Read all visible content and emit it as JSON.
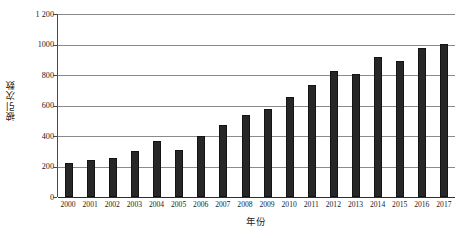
{
  "chart_data": {
    "type": "bar",
    "title": "",
    "xlabel": "年份",
    "ylabel": "被引次数",
    "categories": [
      "2000",
      "2001",
      "2002",
      "2003",
      "2004",
      "2005",
      "2006",
      "2007",
      "2008",
      "2009",
      "2010",
      "2011",
      "2012",
      "2013",
      "2014",
      "2015",
      "2016",
      "2017"
    ],
    "values": [
      220,
      240,
      255,
      300,
      365,
      310,
      400,
      475,
      535,
      580,
      655,
      735,
      825,
      805,
      920,
      890,
      980,
      1005
    ],
    "ylim": [
      0,
      1200
    ],
    "ytick_values": [
      0,
      200,
      400,
      600,
      800,
      1000,
      1200
    ],
    "ytick_labels": [
      "0",
      "200",
      "400",
      "600",
      "800",
      "1000",
      "1 200"
    ],
    "grid": true,
    "legend": null,
    "bar_color": "#272727",
    "gridline_color": "#8a8a8a",
    "axis_color": "#4a4a4a",
    "series": [
      {
        "name": "被引次数",
        "values": [
          220,
          240,
          255,
          300,
          365,
          310,
          400,
          475,
          535,
          580,
          655,
          735,
          825,
          805,
          920,
          890,
          980,
          1005
        ]
      }
    ]
  }
}
